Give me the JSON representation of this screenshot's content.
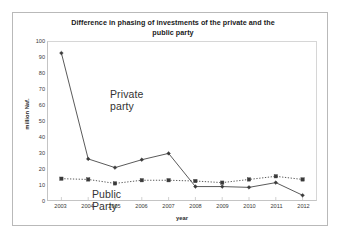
{
  "chart_data": {
    "type": "line",
    "title": "Difference in phasing of investments of the private and the public party",
    "title_line1": "Difference in phasing of investments of the private and the",
    "title_line2": "public party",
    "xlabel": "year",
    "ylabel": "million Naf.",
    "categories": [
      "2003",
      "2004",
      "2005",
      "2006",
      "2007",
      "2008",
      "2009",
      "2010",
      "2011",
      "2012"
    ],
    "x": [
      2003,
      2004,
      2005,
      2006,
      2007,
      2008,
      2009,
      2010,
      2011,
      2012
    ],
    "ylim": [
      0,
      100
    ],
    "yticks": [
      0,
      10,
      20,
      30,
      40,
      50,
      60,
      70,
      80,
      90,
      100
    ],
    "grid": false,
    "legend_position": "in-plot-annotations",
    "series": [
      {
        "name": "Private party",
        "label_line1": "Private",
        "label_line2": "party",
        "line_style": "solid",
        "marker": "diamond",
        "color": "#3a3a3a",
        "values": [
          93,
          26,
          20.5,
          25.5,
          29.5,
          8.5,
          8.5,
          8,
          11,
          3
        ]
      },
      {
        "name": "Public Party",
        "label_line1": "Public",
        "label_line2": "Party",
        "line_style": "dotted",
        "marker": "square",
        "color": "#3a3a3a",
        "values": [
          13.5,
          13,
          10.5,
          12.5,
          12.5,
          12,
          11,
          13,
          15,
          13
        ]
      }
    ]
  },
  "annotations": {
    "private": "Private\nparty",
    "public": "Public\nParty"
  }
}
